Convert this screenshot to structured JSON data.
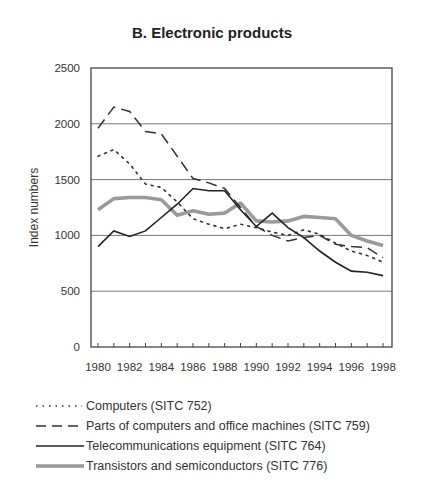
{
  "chart_data": {
    "type": "line",
    "title": "B. Electronic products",
    "xlabel": "",
    "ylabel": "Index numbers",
    "ylim": [
      0,
      2500
    ],
    "yticks": [
      0,
      500,
      1000,
      1500,
      2000,
      2500
    ],
    "xticks": [
      1980,
      1982,
      1984,
      1986,
      1988,
      1990,
      1992,
      1994,
      1996,
      1998
    ],
    "grid": "horizontal",
    "legend_position": "bottom",
    "x": [
      1980,
      1981,
      1982,
      1983,
      1984,
      1985,
      1986,
      1987,
      1988,
      1989,
      1990,
      1991,
      1992,
      1993,
      1994,
      1995,
      1996,
      1997,
      1998
    ],
    "series": [
      {
        "name": "Computers (SITC 752)",
        "style": "dotted",
        "color": "#333333",
        "values": [
          1710,
          1770,
          1640,
          1460,
          1430,
          1300,
          1150,
          1100,
          1060,
          1100,
          1070,
          1030,
          1000,
          1050,
          1010,
          930,
          860,
          820,
          760
        ]
      },
      {
        "name": "Parts of computers and office machines (SITC 759)",
        "style": "dashed",
        "color": "#333333",
        "values": [
          1960,
          2150,
          2110,
          1930,
          1910,
          1710,
          1510,
          1470,
          1420,
          1250,
          1080,
          1000,
          950,
          980,
          1000,
          920,
          900,
          890,
          800
        ]
      },
      {
        "name": "Telecommunications equipment (SITC 764)",
        "style": "solid",
        "color": "#222222",
        "values": [
          900,
          1040,
          990,
          1040,
          1160,
          1280,
          1420,
          1400,
          1400,
          1230,
          1080,
          1200,
          1070,
          980,
          860,
          760,
          680,
          670,
          640
        ]
      },
      {
        "name": "Transistors and semiconductors (SITC 776)",
        "style": "thick-gray",
        "color": "#999999",
        "values": [
          1230,
          1330,
          1340,
          1340,
          1320,
          1180,
          1220,
          1190,
          1200,
          1290,
          1130,
          1120,
          1130,
          1170,
          1160,
          1150,
          1000,
          950,
          910
        ]
      }
    ]
  },
  "title": "B. Electronic products",
  "axis": {
    "ylabel": "Index numbers"
  },
  "legend": [
    {
      "label": "Computers (SITC 752)"
    },
    {
      "label": "Parts of computers and office machines (SITC 759)"
    },
    {
      "label": "Telecommunications equipment (SITC 764)"
    },
    {
      "label": "Transistors and semiconductors (SITC 776)"
    }
  ]
}
